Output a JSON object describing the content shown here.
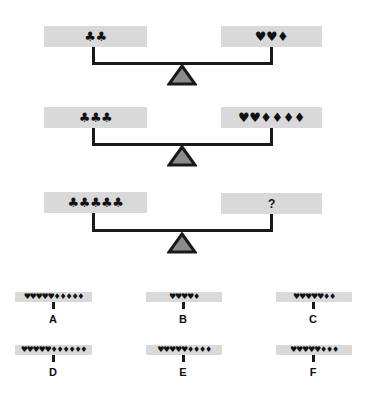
{
  "colors": {
    "pan_fill": "#d9d9d9",
    "beam": "#1a1a1a",
    "fulcrum_fill": "#8c8c8c",
    "fulcrum_stroke": "#1a1a1a"
  },
  "scales": [
    {
      "left": "♣♣",
      "right": "♥♥♦"
    },
    {
      "left": "♣♣♣",
      "right": "♥♥♦♦♦♦"
    },
    {
      "left": "♣♣♣♣♣",
      "right": "?"
    }
  ],
  "options": [
    {
      "label": "A",
      "symbols": "♥♥♥♥♥♦♦♦♦♦"
    },
    {
      "label": "B",
      "symbols": "♥♥♥♥♦"
    },
    {
      "label": "C",
      "symbols": "♥♥♥♥♥♦♦"
    },
    {
      "label": "D",
      "symbols": "♥♥♥♥♥♦♦♦♦♦♦"
    },
    {
      "label": "E",
      "symbols": "♥♥♥♥♥♦♦♦♦"
    },
    {
      "label": "F",
      "symbols": "♥♥♥♥♥♦♦♦"
    }
  ]
}
